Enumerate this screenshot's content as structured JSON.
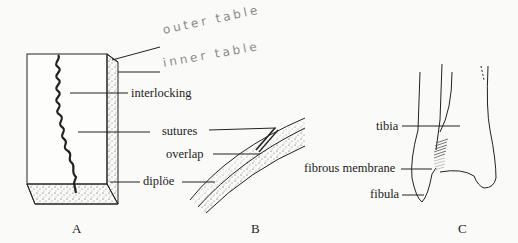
{
  "handwritten": {
    "outer_table": "outer table",
    "inner_table": "inner table"
  },
  "figure_a": {
    "caption": "A",
    "labels": {
      "interlocking": "interlocking",
      "sutures": "sutures",
      "overlap": "overlap",
      "diploe": "diplöe"
    }
  },
  "figure_b": {
    "caption": "B"
  },
  "figure_c": {
    "caption": "C",
    "labels": {
      "tibia": "tibia",
      "fibrous_membrane": "fibrous membrane",
      "fibula": "fibula"
    }
  },
  "colors": {
    "ink": "#222222",
    "pencil": "#8a8a8a",
    "background": "#fafaf8"
  }
}
